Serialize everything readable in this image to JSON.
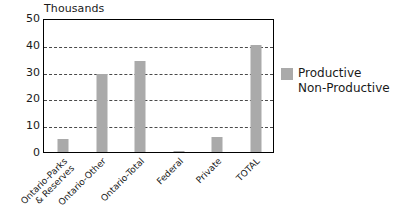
{
  "chart_data": {
    "type": "bar",
    "title": "",
    "unit_label": "Thousands",
    "xlabel": "",
    "ylabel": "",
    "ylim": [
      0,
      50
    ],
    "ytick_values": [
      0,
      10,
      20,
      30,
      40,
      50
    ],
    "ytick_labels": [
      "0",
      "10",
      "20",
      "30",
      "40",
      "50"
    ],
    "grid": "horizontal-dashed",
    "gridline_values": [
      10,
      20,
      30,
      40
    ],
    "legend_position": "right",
    "categories": [
      "Ontario-Parks & Reserves",
      "Ontario-Other",
      "Ontario-Total",
      "Federal",
      "Private",
      "TOTAL"
    ],
    "category_label_lines": [
      [
        "Ontario-Parks",
        "& Reserves"
      ],
      [
        "Ontario-Other",
        ""
      ],
      [
        "Ontario-Total",
        ""
      ],
      [
        "Federal",
        ""
      ],
      [
        "Private",
        ""
      ],
      [
        "TOTAL",
        ""
      ]
    ],
    "series": [
      {
        "name": "Productive\nNon-Productive",
        "color": "#aaaaaa",
        "values": [
          5,
          29,
          34,
          0.5,
          5.5,
          40
        ]
      }
    ]
  },
  "legend": {
    "entries": [
      {
        "label": "Productive\nNon-Productive",
        "color": "#aaaaaa"
      }
    ]
  },
  "axis": {
    "unit_label": "Thousands"
  }
}
